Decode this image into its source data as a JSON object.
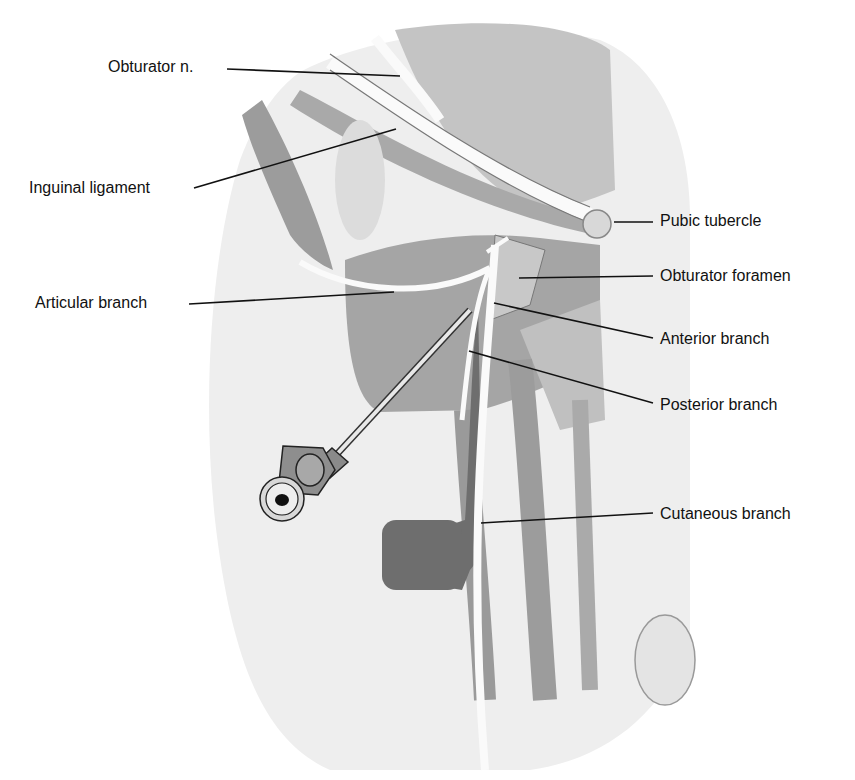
{
  "diagram": {
    "labels": {
      "obturator_n": "Obturator n.",
      "inguinal_ligament": "Inguinal ligament",
      "articular_branch": "Articular branch",
      "pubic_tubercle": "Pubic tubercle",
      "obturator_foramen": "Obturator foramen",
      "anterior_branch": "Anterior branch",
      "posterior_branch": "Posterior branch",
      "cutaneous_branch": "Cutaneous branch"
    },
    "colors": {
      "background": "#ffffff",
      "skin": "#efefef",
      "muscle_light": "#d6d6d6",
      "muscle_mid": "#b8b8b8",
      "muscle_dark": "#8c8c8c",
      "nerve": "#fafafa",
      "leader": "#111111"
    }
  }
}
